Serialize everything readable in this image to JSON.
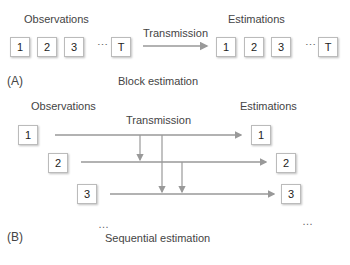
{
  "panel_a": {
    "observations_label": "Observations",
    "estimations_label": "Estimations",
    "transmission_label": "Transmission",
    "obs_boxes": [
      "1",
      "2",
      "3",
      "T"
    ],
    "est_boxes": [
      "1",
      "2",
      "3",
      "T"
    ],
    "ellipsis": "⋯",
    "tag": "(A)",
    "caption": "Block estimation"
  },
  "panel_b": {
    "observations_label": "Observations",
    "estimations_label": "Estimations",
    "transmission_label": "Transmission",
    "obs_boxes": [
      "1",
      "2",
      "3"
    ],
    "est_boxes": [
      "1",
      "2",
      "3"
    ],
    "ellipsis": "…",
    "tag": "(B)",
    "caption": "Sequential estimation"
  },
  "colors": {
    "arrow": "#999999",
    "box_border": "#bbbbbb"
  }
}
